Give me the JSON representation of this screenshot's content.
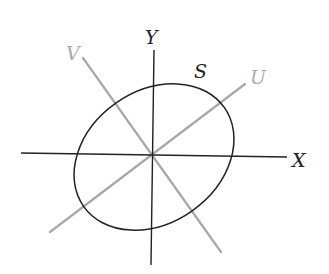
{
  "diagram": {
    "title": "",
    "colors": {
      "axis": "#222222",
      "rotated_axis": "#a8a8a8",
      "ellipse": "#222222",
      "label_dark": "#222222",
      "label_light": "#aaaaaa"
    },
    "labels": {
      "x_axis": "X",
      "y_axis": "Y",
      "u_axis": "U",
      "v_axis": "V",
      "ellipse": "S"
    },
    "geometry": {
      "origin": [
        153,
        155
      ],
      "x_axis": {
        "from": [
          21,
          153
        ],
        "to": [
          287,
          157
        ]
      },
      "y_axis": {
        "from": [
          154,
          50
        ],
        "to": [
          151,
          265
        ]
      },
      "u_axis": {
        "from": [
          50,
          232
        ],
        "to": [
          245,
          84
        ]
      },
      "v_axis": {
        "from": [
          83,
          58
        ],
        "to": [
          221,
          252
        ]
      },
      "ellipse": {
        "cx": 154,
        "cy": 157,
        "rx": 86,
        "ry": 66,
        "rotation_deg": -35
      }
    }
  }
}
